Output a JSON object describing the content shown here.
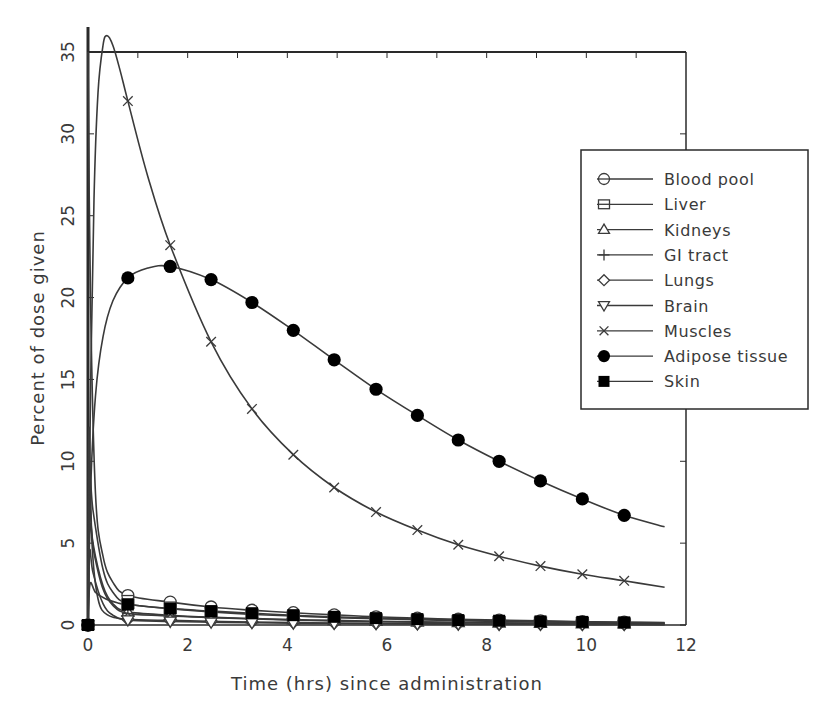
{
  "chart_data": {
    "type": "line",
    "title": "",
    "xlabel": "Time (hrs) since administration",
    "ylabel": "Percent of dose given",
    "xlim": [
      0,
      12
    ],
    "ylim": [
      0,
      35
    ],
    "xticks": [
      0,
      2,
      4,
      6,
      8,
      10,
      12
    ],
    "yticks": [
      0,
      5,
      10,
      15,
      20,
      25,
      30,
      35
    ],
    "ytick_labels_rotated": true,
    "grid": false,
    "legend_position": "right, upper-middle (inside frame, overlapping right edge)",
    "marker_times": [
      0.8,
      1.65,
      2.47,
      3.29,
      4.12,
      4.94,
      5.78,
      6.61,
      7.43,
      8.25,
      9.08,
      9.92,
      10.76
    ],
    "series": [
      {
        "name": "Blood pool",
        "marker": "circle-open",
        "curve": [
          [
            0,
            35
          ],
          [
            0.05,
            20
          ],
          [
            0.15,
            8
          ],
          [
            0.3,
            4.2
          ],
          [
            0.5,
            2.6
          ],
          [
            0.8,
            1.8
          ],
          [
            1.65,
            1.4
          ],
          [
            2.47,
            1.1
          ],
          [
            3.29,
            0.9
          ],
          [
            4.12,
            0.75
          ],
          [
            4.94,
            0.62
          ],
          [
            5.78,
            0.5
          ],
          [
            6.61,
            0.42
          ],
          [
            7.43,
            0.35
          ],
          [
            8.25,
            0.3
          ],
          [
            9.08,
            0.25
          ],
          [
            9.92,
            0.2
          ],
          [
            10.76,
            0.17
          ],
          [
            11.57,
            0.15
          ]
        ]
      },
      {
        "name": "Liver",
        "marker": "square-open",
        "curve": [
          [
            0,
            0
          ],
          [
            0.03,
            9
          ],
          [
            0.1,
            7
          ],
          [
            0.3,
            3.4
          ],
          [
            0.5,
            2.0
          ],
          [
            0.8,
            1.3
          ],
          [
            1.65,
            1.0
          ],
          [
            2.47,
            0.8
          ],
          [
            3.29,
            0.65
          ],
          [
            4.12,
            0.55
          ],
          [
            4.94,
            0.45
          ],
          [
            5.78,
            0.38
          ],
          [
            6.61,
            0.32
          ],
          [
            7.43,
            0.27
          ],
          [
            8.25,
            0.22
          ],
          [
            9.08,
            0.19
          ],
          [
            9.92,
            0.16
          ],
          [
            10.76,
            0.13
          ],
          [
            11.57,
            0.11
          ]
        ]
      },
      {
        "name": "Kidneys",
        "marker": "triangle-up-open",
        "curve": [
          [
            0,
            0
          ],
          [
            0.03,
            7
          ],
          [
            0.1,
            5
          ],
          [
            0.3,
            2.4
          ],
          [
            0.5,
            1.3
          ],
          [
            0.8,
            0.8
          ],
          [
            1.65,
            0.6
          ],
          [
            2.47,
            0.48
          ],
          [
            3.29,
            0.4
          ],
          [
            4.12,
            0.33
          ],
          [
            4.94,
            0.28
          ],
          [
            5.78,
            0.23
          ],
          [
            6.61,
            0.19
          ],
          [
            7.43,
            0.16
          ],
          [
            8.25,
            0.13
          ],
          [
            9.08,
            0.11
          ],
          [
            9.92,
            0.09
          ],
          [
            10.76,
            0.08
          ],
          [
            11.57,
            0.07
          ]
        ]
      },
      {
        "name": "GI tract",
        "marker": "plus",
        "curve": [
          [
            0,
            0
          ],
          [
            0.04,
            6
          ],
          [
            0.12,
            4.4
          ],
          [
            0.3,
            2.2
          ],
          [
            0.5,
            1.2
          ],
          [
            0.8,
            0.7
          ],
          [
            1.65,
            0.55
          ],
          [
            2.47,
            0.45
          ],
          [
            3.29,
            0.37
          ],
          [
            4.12,
            0.3
          ],
          [
            4.94,
            0.25
          ],
          [
            5.78,
            0.2
          ],
          [
            6.61,
            0.17
          ],
          [
            7.43,
            0.14
          ],
          [
            8.25,
            0.12
          ],
          [
            9.08,
            0.1
          ],
          [
            9.92,
            0.08
          ],
          [
            10.76,
            0.07
          ],
          [
            11.57,
            0.06
          ]
        ]
      },
      {
        "name": "Lungs",
        "marker": "diamond-open",
        "curve": [
          [
            0,
            0
          ],
          [
            0.02,
            12
          ],
          [
            0.08,
            5
          ],
          [
            0.2,
            1.6
          ],
          [
            0.4,
            0.6
          ],
          [
            0.8,
            0.35
          ],
          [
            1.65,
            0.28
          ],
          [
            2.47,
            0.22
          ],
          [
            3.29,
            0.18
          ],
          [
            4.12,
            0.15
          ],
          [
            4.94,
            0.12
          ],
          [
            5.78,
            0.1
          ],
          [
            6.61,
            0.08
          ],
          [
            7.43,
            0.07
          ],
          [
            8.25,
            0.06
          ],
          [
            9.08,
            0.05
          ],
          [
            9.92,
            0.04
          ],
          [
            10.76,
            0.04
          ],
          [
            11.57,
            0.03
          ]
        ]
      },
      {
        "name": "Brain",
        "marker": "triangle-down-open",
        "curve": [
          [
            0,
            0
          ],
          [
            0.03,
            4.5
          ],
          [
            0.1,
            3.2
          ],
          [
            0.3,
            1.3
          ],
          [
            0.5,
            0.6
          ],
          [
            0.8,
            0.3
          ],
          [
            1.65,
            0.22
          ],
          [
            2.47,
            0.17
          ],
          [
            3.29,
            0.14
          ],
          [
            4.12,
            0.11
          ],
          [
            4.94,
            0.09
          ],
          [
            5.78,
            0.08
          ],
          [
            6.61,
            0.06
          ],
          [
            7.43,
            0.05
          ],
          [
            8.25,
            0.04
          ],
          [
            9.08,
            0.04
          ],
          [
            9.92,
            0.03
          ],
          [
            10.76,
            0.03
          ],
          [
            11.57,
            0.02
          ]
        ]
      },
      {
        "name": "Muscles",
        "marker": "x",
        "curve": [
          [
            0,
            0
          ],
          [
            0.05,
            14
          ],
          [
            0.12,
            26
          ],
          [
            0.2,
            32.5
          ],
          [
            0.3,
            35.4
          ],
          [
            0.38,
            36.0
          ],
          [
            0.5,
            35.4
          ],
          [
            0.65,
            33.8
          ],
          [
            0.8,
            32.0
          ],
          [
            1.2,
            27.4
          ],
          [
            1.65,
            23.2
          ],
          [
            2.47,
            17.3
          ],
          [
            3.29,
            13.2
          ],
          [
            4.12,
            10.4
          ],
          [
            4.94,
            8.4
          ],
          [
            5.78,
            6.9
          ],
          [
            6.61,
            5.8
          ],
          [
            7.43,
            4.9
          ],
          [
            8.25,
            4.2
          ],
          [
            9.08,
            3.6
          ],
          [
            9.92,
            3.1
          ],
          [
            10.76,
            2.7
          ],
          [
            11.57,
            2.3
          ]
        ]
      },
      {
        "name": "Adipose tissue",
        "marker": "circle-filled",
        "curve": [
          [
            0,
            0
          ],
          [
            0.05,
            8
          ],
          [
            0.15,
            14
          ],
          [
            0.3,
            17.6
          ],
          [
            0.5,
            19.8
          ],
          [
            0.8,
            21.2
          ],
          [
            1.2,
            21.8
          ],
          [
            1.65,
            21.9
          ],
          [
            2.47,
            21.1
          ],
          [
            3.29,
            19.7
          ],
          [
            4.12,
            18.0
          ],
          [
            4.94,
            16.2
          ],
          [
            5.78,
            14.4
          ],
          [
            6.61,
            12.8
          ],
          [
            7.43,
            11.3
          ],
          [
            8.25,
            10.0
          ],
          [
            9.08,
            8.8
          ],
          [
            9.92,
            7.7
          ],
          [
            10.76,
            6.7
          ],
          [
            11.57,
            6.0
          ]
        ]
      },
      {
        "name": "Skin",
        "marker": "square-filled",
        "curve": [
          [
            0,
            0
          ],
          [
            0.04,
            2.5
          ],
          [
            0.15,
            2.0
          ],
          [
            0.35,
            1.6
          ],
          [
            0.6,
            1.35
          ],
          [
            0.8,
            1.25
          ],
          [
            1.65,
            1.0
          ],
          [
            2.47,
            0.85
          ],
          [
            3.29,
            0.72
          ],
          [
            4.12,
            0.6
          ],
          [
            4.94,
            0.5
          ],
          [
            5.78,
            0.42
          ],
          [
            6.61,
            0.36
          ],
          [
            7.43,
            0.3
          ],
          [
            8.25,
            0.26
          ],
          [
            9.08,
            0.22
          ],
          [
            9.92,
            0.19
          ],
          [
            10.76,
            0.16
          ],
          [
            11.57,
            0.14
          ]
        ]
      }
    ]
  },
  "layout_px": {
    "plot_left": 88,
    "plot_right": 686,
    "plot_top": 52,
    "plot_bottom": 625,
    "yaxis_extend_top": 27,
    "legend": {
      "left": 581,
      "top": 150,
      "right": 808,
      "bottom": 409,
      "row_start": 179,
      "row_step": 25.3
    }
  },
  "colors": {
    "line": "#3a3a3a",
    "frame": "#2a2a2a",
    "text": "#3a3a3a",
    "background": "#ffffff"
  }
}
